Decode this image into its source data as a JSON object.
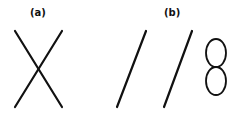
{
  "panels": [
    {
      "label": "(a)",
      "shape": "crossed-lines-x"
    },
    {
      "label": "(b)",
      "shape": "two-parallel-slashes-and-figure-eight"
    }
  ],
  "colors": {
    "stroke": "#111111",
    "background": "#ffffff"
  }
}
